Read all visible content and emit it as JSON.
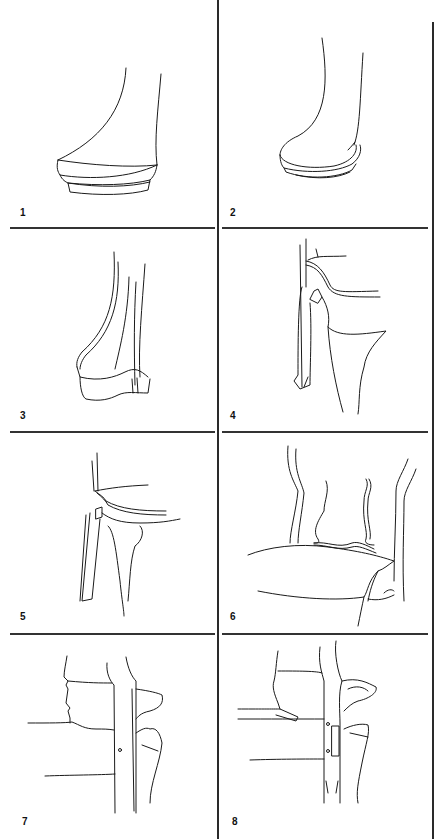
{
  "figure": {
    "panels": [
      {
        "id": 1,
        "label": "1",
        "subject": "leg foot with stepped pad"
      },
      {
        "id": 2,
        "label": "2",
        "subject": "leg foot with rounded pad"
      },
      {
        "id": 3,
        "label": "3",
        "subject": "leg foot with shaped pad"
      },
      {
        "id": 4,
        "label": "4",
        "subject": "leg joining seat rail, angled view"
      },
      {
        "id": 5,
        "label": "5",
        "subject": "leg joining seat rail, side view"
      },
      {
        "id": 6,
        "label": "6",
        "subject": "chair back and seat cushion"
      },
      {
        "id": 7,
        "label": "7",
        "subject": "leg and rail joint with single pin"
      },
      {
        "id": 8,
        "label": "8",
        "subject": "leg and rail joint with mortise slot and two pins"
      }
    ]
  }
}
